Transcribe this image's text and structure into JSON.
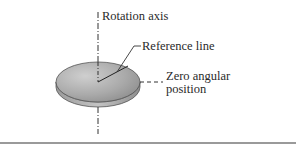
{
  "figure": {
    "labels": {
      "rotation_axis": "Rotation axis",
      "reference_line": "Reference line",
      "zero_angular_line1": "Zero angular",
      "zero_angular_line2": "position"
    },
    "colors": {
      "disk_top_light": "#c9c9c9",
      "disk_top_dark": "#8f8f8f",
      "disk_edge": "#a8a8a8",
      "line": "#333333",
      "rule": "#9a9a9a"
    }
  }
}
